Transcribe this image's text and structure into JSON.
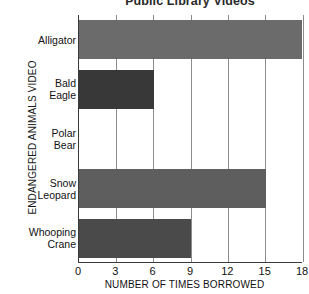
{
  "chart_data": {
    "type": "bar",
    "orientation": "horizontal",
    "title": "Public Library Videos",
    "xlabel": "NUMBER OF TIMES BORROWED",
    "ylabel": "ENDANGERED ANIMALS VIDEO",
    "categories": [
      "Alligator",
      "Bald Eagle",
      "Polar Bear",
      "Snow Leopard",
      "Whooping Crane"
    ],
    "category_lines": [
      [
        "Alligator"
      ],
      [
        "Bald",
        "Eagle"
      ],
      [
        "Polar",
        "Bear"
      ],
      [
        "Snow",
        "Leopard"
      ],
      [
        "Whooping",
        "Crane"
      ]
    ],
    "values": [
      18,
      6,
      0,
      15,
      9
    ],
    "bar_colors": [
      "#6b6b6b",
      "#383838",
      "#000000",
      "#5e5e5e",
      "#4a4a4a"
    ],
    "xlim": [
      0,
      18
    ],
    "xticks": [
      0,
      3,
      6,
      9,
      12,
      15,
      18
    ],
    "xtick_labels": [
      "0",
      "3",
      "6",
      "9",
      "12",
      "15",
      "18"
    ],
    "grid": true,
    "grid_axis": "x",
    "legend": false
  }
}
